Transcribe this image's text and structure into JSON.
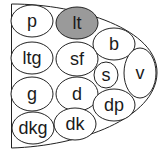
{
  "diagram": {
    "outline": "half-dome shape, flat left edge, curved right",
    "stroke_color": "#222222",
    "highlight_color": "#9a9a9a",
    "nodes": [
      {
        "id": "p",
        "label": "p",
        "cx": 32,
        "cy": 21,
        "rx": 21,
        "ry": 16,
        "highlighted": false
      },
      {
        "id": "lt",
        "label": "lt",
        "cx": 77,
        "cy": 23,
        "rx": 21,
        "ry": 16,
        "highlighted": true
      },
      {
        "id": "b",
        "label": "b",
        "cx": 114,
        "cy": 44,
        "rx": 21,
        "ry": 16,
        "highlighted": false
      },
      {
        "id": "ltg",
        "label": "ltg",
        "cx": 32,
        "cy": 58,
        "rx": 21,
        "ry": 16,
        "highlighted": false
      },
      {
        "id": "sf",
        "label": "sf",
        "cx": 77,
        "cy": 59,
        "rx": 21,
        "ry": 17,
        "highlighted": false
      },
      {
        "id": "s",
        "label": "s",
        "cx": 106,
        "cy": 75,
        "rx": 12,
        "ry": 13,
        "highlighted": false
      },
      {
        "id": "v",
        "label": "v",
        "cx": 140,
        "cy": 73,
        "rx": 16,
        "ry": 25,
        "highlighted": false
      },
      {
        "id": "g",
        "label": "g",
        "cx": 32,
        "cy": 94,
        "rx": 21,
        "ry": 17,
        "highlighted": false
      },
      {
        "id": "d",
        "label": "d",
        "cx": 77,
        "cy": 94,
        "rx": 21,
        "ry": 17,
        "highlighted": false
      },
      {
        "id": "dp",
        "label": "dp",
        "cx": 114,
        "cy": 105,
        "rx": 21,
        "ry": 16,
        "highlighted": false
      },
      {
        "id": "dkg",
        "label": "dkg",
        "cx": 33,
        "cy": 128,
        "rx": 21,
        "ry": 16,
        "highlighted": false
      },
      {
        "id": "dk",
        "label": "dk",
        "cx": 75,
        "cy": 124,
        "rx": 21,
        "ry": 16,
        "highlighted": false
      }
    ]
  }
}
